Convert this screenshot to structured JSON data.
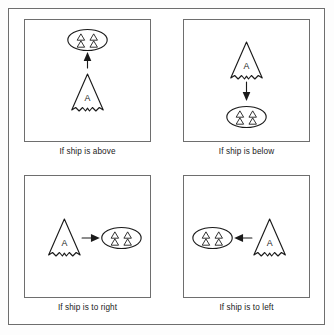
{
  "figure": {
    "panel_count": 4,
    "layout": "2x2 grid",
    "frame_color": "#6e6e6e",
    "ink_color": "#1a1a1a",
    "background_color": "#ffffff"
  },
  "symbols": {
    "ship": {
      "name": "ship-cone-symbol",
      "label": "A",
      "description": "cone with scalloped bottom edge"
    },
    "fleet": {
      "name": "fleet-ellipse-symbol",
      "triangle_count": 4,
      "description": "ellipse containing four small triangles"
    },
    "arrow": {
      "name": "direction-arrow",
      "description": "solid-headed arrow pointing from ship toward fleet"
    }
  },
  "panels": [
    {
      "id": "above",
      "caption": "If ship is above",
      "arrow_direction": "up",
      "ship_position": "bottom",
      "fleet_position": "top"
    },
    {
      "id": "below",
      "caption": "If ship is below",
      "arrow_direction": "down",
      "ship_position": "top",
      "fleet_position": "bottom"
    },
    {
      "id": "right",
      "caption": "If ship is to right",
      "arrow_direction": "right",
      "ship_position": "left",
      "fleet_position": "right"
    },
    {
      "id": "left",
      "caption": "If ship is to left",
      "arrow_direction": "left",
      "ship_position": "right",
      "fleet_position": "left"
    }
  ]
}
